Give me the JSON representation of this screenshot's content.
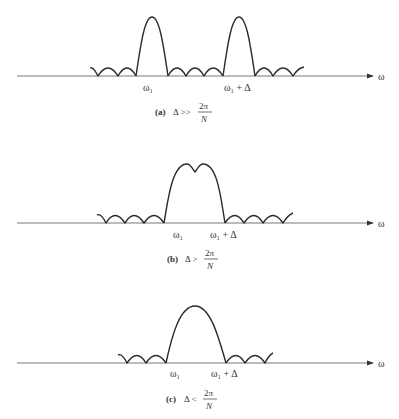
{
  "axis_label": "ω",
  "panels": [
    {
      "id": "a",
      "tag": "(a)",
      "condition": "Δ >>",
      "frac_num": "2π",
      "frac_den": "N",
      "label_w1": "ω₁",
      "label_w1_delta": "ω₁ + Δ"
    },
    {
      "id": "b",
      "tag": "(b)",
      "condition": "Δ >",
      "frac_num": "2π",
      "frac_den": "N",
      "label_w1": "ω₁",
      "label_w1_delta": "ω₁ + Δ"
    },
    {
      "id": "c",
      "tag": "(c)",
      "condition": "Δ <",
      "frac_num": "2π",
      "frac_den": "N",
      "label_w1": "ω₁",
      "label_w1_delta": "ω₁ + Δ"
    }
  ]
}
